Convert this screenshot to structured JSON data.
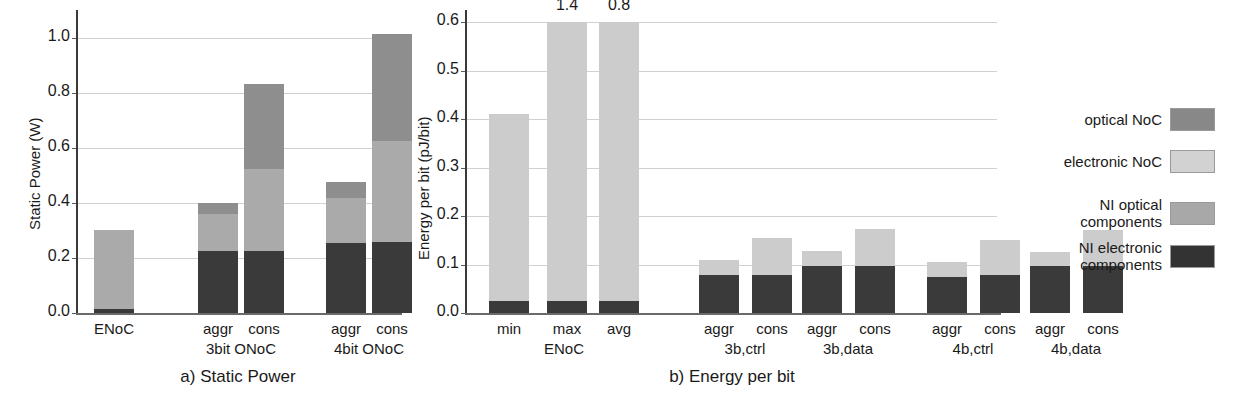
{
  "chart_data": [
    {
      "type": "bar",
      "id": "static-power",
      "title": "a) Static Power",
      "xlabel": "",
      "ylabel": "Static Power (W)",
      "ylim": [
        0.0,
        1.06
      ],
      "yticks": [
        "0.0",
        "0.2",
        "0.4",
        "0.6",
        "0.8",
        "1.0"
      ],
      "ytick_values": [
        0.0,
        0.2,
        0.4,
        0.6,
        0.8,
        1.0
      ],
      "grid": true,
      "stacked": true,
      "legend_position": "right-outside",
      "categories": [
        "ENoC",
        "aggr",
        "cons",
        "aggr",
        "cons"
      ],
      "groups": [
        {
          "label": "",
          "members": [
            "ENoC"
          ]
        },
        {
          "label": "3bit ONoC",
          "members": [
            "aggr",
            "cons"
          ]
        },
        {
          "label": "4bit ONoC",
          "members": [
            "aggr",
            "cons"
          ]
        }
      ],
      "series": [
        {
          "name": "NI electronic components",
          "values": [
            0.013,
            0.226,
            0.226,
            0.256,
            0.257
          ]
        },
        {
          "name": "NI optical components",
          "values": [
            0.288,
            0.133,
            0.3,
            0.164,
            0.37
          ]
        },
        {
          "name": "electronic NoC",
          "values": [
            0.0,
            0.0,
            0.0,
            0.0,
            0.0
          ]
        },
        {
          "name": "optical NoC",
          "values": [
            0.0,
            0.043,
            0.308,
            0.057,
            0.388
          ]
        }
      ],
      "totals": [
        0.301,
        0.402,
        0.834,
        0.477,
        1.015
      ]
    },
    {
      "type": "bar",
      "id": "energy-per-bit",
      "title": "b) Energy per bit",
      "xlabel": "",
      "ylabel": "Energy per bit (pJ/bit)",
      "ylim": [
        0.0,
        0.6
      ],
      "yticks": [
        "0.0",
        "0.1",
        "0.2",
        "0.3",
        "0.4",
        "0.5",
        "0.6"
      ],
      "ytick_values": [
        0.0,
        0.1,
        0.2,
        0.3,
        0.4,
        0.5,
        0.6
      ],
      "grid": true,
      "stacked": true,
      "categories": [
        "min",
        "max",
        "avg",
        "aggr",
        "cons",
        "aggr",
        "cons",
        "aggr",
        "cons",
        "aggr",
        "cons"
      ],
      "groups": [
        {
          "label": "ENoC",
          "members": [
            "min",
            "max",
            "avg"
          ]
        },
        {
          "label": "3b,ctrl",
          "members": [
            "aggr",
            "cons"
          ]
        },
        {
          "label": "3b,data",
          "members": [
            "aggr",
            "cons"
          ]
        },
        {
          "label": "4b,ctrl",
          "members": [
            "aggr",
            "cons"
          ]
        },
        {
          "label": "4b,data",
          "members": [
            "aggr",
            "cons"
          ]
        }
      ],
      "series": [
        {
          "name": "NI electronic components",
          "values": [
            0.024,
            0.024,
            0.024,
            0.079,
            0.079,
            0.097,
            0.097,
            0.075,
            0.078,
            0.097,
            0.097
          ]
        },
        {
          "name": "electronic NoC",
          "values": [
            0.386,
            0.576,
            0.576,
            0.031,
            0.076,
            0.031,
            0.076,
            0.03,
            0.072,
            0.029,
            0.074
          ]
        }
      ],
      "totals": [
        0.41,
        1.4,
        0.8,
        0.11,
        0.155,
        0.128,
        0.173,
        0.105,
        0.15,
        0.126,
        0.171
      ],
      "clipped_value_labels": [
        {
          "category": "max",
          "value": "1.4"
        },
        {
          "category": "avg",
          "value": "0.8"
        }
      ]
    }
  ],
  "legend": {
    "items": [
      {
        "label": "optical NoC",
        "color": "#888888"
      },
      {
        "label": "electronic NoC",
        "color": "#d2d2d2"
      },
      {
        "label": "NI optical\ncomponents",
        "color": "#a8a8a8"
      },
      {
        "label": "NI electronic\ncomponents",
        "color": "#333333"
      }
    ]
  },
  "colors": {
    "ni_electronic": "#3a3a3a",
    "ni_optical": "#aaaaaa",
    "electronic_noc": "#cccccc",
    "optical_noc": "#8e8e8e",
    "axis": "#3a3a3a",
    "grid": "#c9c9c9",
    "text": "#1a1a1a",
    "background": "#ffffff"
  }
}
